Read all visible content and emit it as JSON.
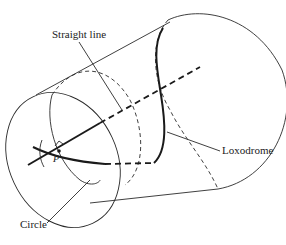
{
  "diagram": {
    "title": "",
    "labels": {
      "straight_line": "Straight line",
      "loxodrome": "Loxodrome",
      "circle": "Circle",
      "point": "P"
    },
    "elements": [
      "cylinder",
      "front-ellipse",
      "back-ellipse",
      "cylinder-axis",
      "straight-line",
      "loxodrome",
      "circle",
      "right-angle-marker",
      "point-P"
    ],
    "colors": {
      "line": "#2a2a2a",
      "background": "#ffffff"
    }
  }
}
